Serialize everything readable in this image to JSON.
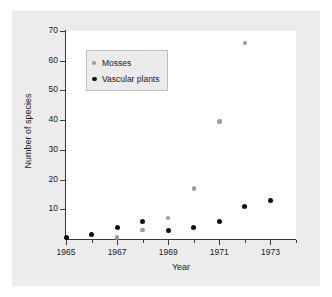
{
  "chart_data": {
    "type": "scatter",
    "title": "",
    "xlabel": "Year",
    "ylabel": "Number of species",
    "xlim": [
      1965,
      1974
    ],
    "ylim": [
      0,
      70
    ],
    "xticks": [
      1965,
      1967,
      1969,
      1971,
      1973
    ],
    "xticks_minor": [
      1966,
      1968,
      1970,
      1972,
      1974
    ],
    "yticks": [
      10,
      20,
      30,
      40,
      50,
      60,
      70
    ],
    "grid": false,
    "legend_position": "upper-left-inside",
    "series": [
      {
        "name": "Mosses",
        "color": "#9a9a9a",
        "marker": "circle",
        "x": [
          1967,
          1968,
          1969,
          1970,
          1971,
          1972
        ],
        "values": [
          0.5,
          3,
          7,
          17,
          39.5,
          66
        ]
      },
      {
        "name": "Vascular plants",
        "color": "#111111",
        "marker": "circle",
        "x": [
          1965,
          1966,
          1967,
          1968,
          1969,
          1970,
          1971,
          1972,
          1973
        ],
        "values": [
          0.5,
          1.5,
          4,
          6,
          3,
          4,
          6,
          11,
          13
        ]
      }
    ]
  },
  "figure": {
    "background": "#ffffff",
    "mat_color": "#ececec",
    "plot_background": "#ffffff",
    "axis_color": "#3a3a3a"
  },
  "axis": {
    "y_tick_labels": [
      "70",
      "60",
      "50",
      "40",
      "30",
      "20",
      "10"
    ],
    "x_tick_labels": [
      "1965",
      "1967",
      "1969",
      "1971",
      "1973"
    ],
    "x_axis_title": "Year",
    "y_axis_title": "Number of species"
  },
  "legend": {
    "items": [
      {
        "label": "Mosses",
        "color": "#9a9a9a"
      },
      {
        "label": "Vascular plants",
        "color": "#111111"
      }
    ]
  }
}
